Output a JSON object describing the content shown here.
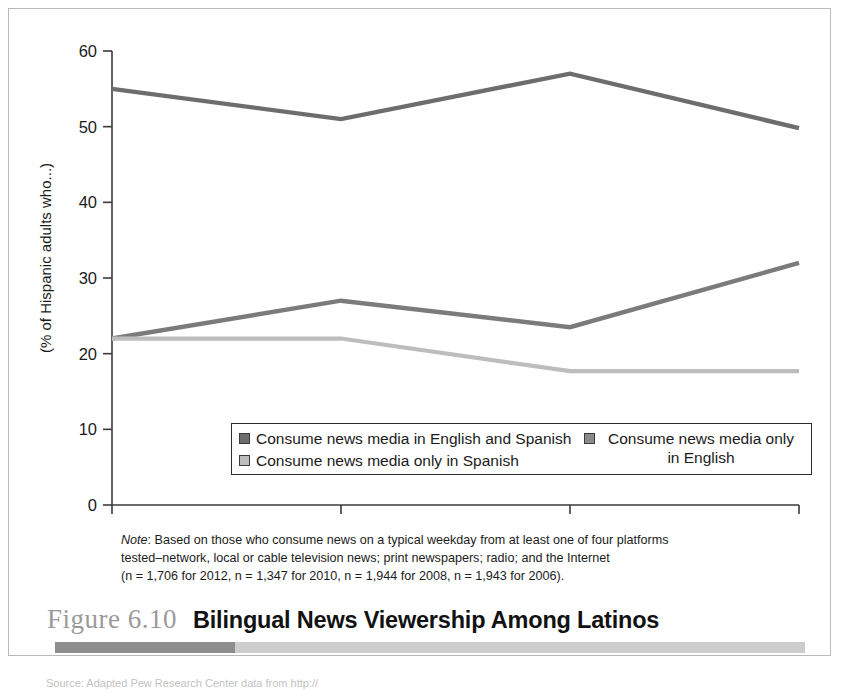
{
  "figure": {
    "number": "Figure 6.10",
    "title": "Bilingual News Viewership Among Latinos"
  },
  "note": {
    "label": "Note",
    "line1": ": Based on those who consume news on a typical weekday from at least one of four platforms",
    "line2": "tested–network, local or cable television news; print newspapers; radio; and the Internet",
    "line3": "(n = 1,706 for 2012, n = 1,347 for 2010, n = 1,944 for 2008, n = 1,943 for 2006)."
  },
  "source": {
    "text": "Source: Adapted Pew Research Center data from http://"
  },
  "legend": {
    "entries": [
      {
        "label": "Consume news media in English and Spanish",
        "color": "#6d6d6d"
      },
      {
        "label": "Consume news media only in Spanish",
        "color": "#bdbdbd"
      },
      {
        "label": "Consume news media only in English",
        "color": "#8a8a8a"
      }
    ]
  },
  "chart_data": {
    "type": "line",
    "title": "Bilingual News Viewership Among Latinos",
    "xlabel": "",
    "ylabel": "(% of Hispanic adults who...)",
    "x": [
      2006,
      2008,
      2010,
      2012
    ],
    "xticklabels": [
      "2006",
      "2008",
      "2010",
      "2012"
    ],
    "yticklabels": [
      "0",
      "10",
      "20",
      "30",
      "40",
      "50",
      "60"
    ],
    "yticks": [
      0,
      10,
      20,
      30,
      40,
      50,
      60
    ],
    "ylim": [
      0,
      60
    ],
    "grid": false,
    "legend_position": "inside-bottom-center",
    "series": [
      {
        "name": "Consume news media only in English",
        "color": "#6d6d6d",
        "values": [
          55,
          51,
          57,
          49.8
        ]
      },
      {
        "name": "Consume news media in English and Spanish",
        "color": "#7b7b7b",
        "values": [
          22,
          27,
          23.5,
          32
        ]
      },
      {
        "name": "Consume news media only in Spanish",
        "color": "#bdbdbd",
        "values": [
          22,
          22,
          17.7,
          17.7
        ]
      }
    ]
  }
}
